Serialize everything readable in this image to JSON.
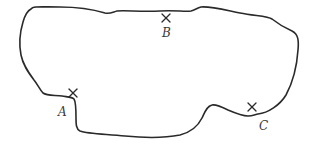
{
  "diagram": {
    "type": "closed-region-outline",
    "stroke_color": "#2a2a2a",
    "points": [
      {
        "id": "A",
        "label": "A",
        "marker": "cross",
        "x": 73,
        "y": 93,
        "label_x": 58,
        "label_y": 106
      },
      {
        "id": "B",
        "label": "B",
        "marker": "cross",
        "x": 166,
        "y": 18,
        "label_x": 162,
        "label_y": 27
      },
      {
        "id": "C",
        "label": "C",
        "marker": "cross",
        "x": 252,
        "y": 107,
        "label_x": 259,
        "label_y": 120
      }
    ]
  }
}
